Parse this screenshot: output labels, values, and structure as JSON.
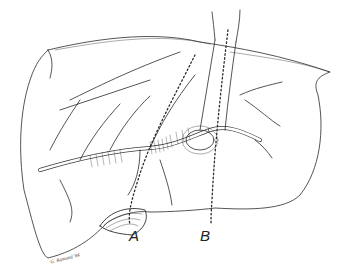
{
  "figure": {
    "labels": [
      {
        "id": "A",
        "text": "A"
      },
      {
        "id": "B",
        "text": "B"
      }
    ],
    "signature": "G. Ramond '84",
    "colors": {
      "ink": "#2a2a2a",
      "background": "#ffffff"
    }
  }
}
